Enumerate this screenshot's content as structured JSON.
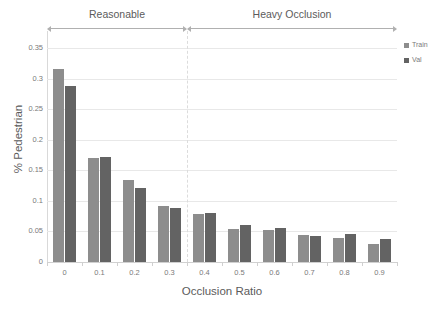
{
  "chart_data": {
    "type": "bar",
    "title": "",
    "xlabel": "Occlusion Ratio",
    "ylabel": "% Pedestrian",
    "categories": [
      "0",
      "0.1",
      "0.2",
      "0.3",
      "0.4",
      "0.5",
      "0.6",
      "0.7",
      "0.8",
      "0.9"
    ],
    "series": [
      {
        "name": "Train",
        "color": "#8d8d8d",
        "values": [
          0.315,
          0.17,
          0.134,
          0.091,
          0.078,
          0.054,
          0.052,
          0.045,
          0.04,
          0.029
        ]
      },
      {
        "name": "Val",
        "color": "#636363",
        "values": [
          0.288,
          0.172,
          0.121,
          0.088,
          0.08,
          0.06,
          0.056,
          0.043,
          0.046,
          0.038
        ]
      }
    ],
    "ylim": [
      0,
      0.35
    ],
    "yticks": [
      "0",
      "0.05",
      "0.1",
      "0.15",
      "0.2",
      "0.25",
      "0.3",
      "0.35"
    ],
    "ytick_values": [
      0,
      0.05,
      0.1,
      0.15,
      0.2,
      0.25,
      0.3,
      0.35
    ],
    "grid": true,
    "grid_axis": "y",
    "legend_position": "right",
    "annotations": [
      {
        "label": "Reasonable",
        "start_category": "0",
        "end_category": "0.3"
      },
      {
        "label": "Heavy Occlusion",
        "start_category": "0.4",
        "end_category": "0.9"
      }
    ],
    "divider_after_category": "0.3"
  },
  "legend": {
    "items": [
      {
        "label": "Train",
        "color": "#8d8d8d"
      },
      {
        "label": "Val",
        "color": "#636363"
      }
    ]
  }
}
